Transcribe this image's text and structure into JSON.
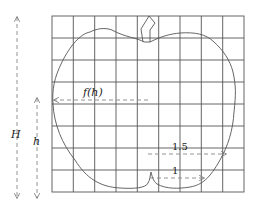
{
  "diagram": {
    "grid": {
      "cols": 9,
      "rows": 8,
      "left": 52,
      "top": 16,
      "right": 244,
      "bottom": 192
    },
    "labels": {
      "H": "H",
      "h": "h",
      "f_h": "f(h)",
      "r_15": "1.5",
      "r_1": "1"
    },
    "colors": {
      "grid": "#555555",
      "outline": "#555555",
      "arrows": "#888888",
      "text": "#222222"
    }
  }
}
